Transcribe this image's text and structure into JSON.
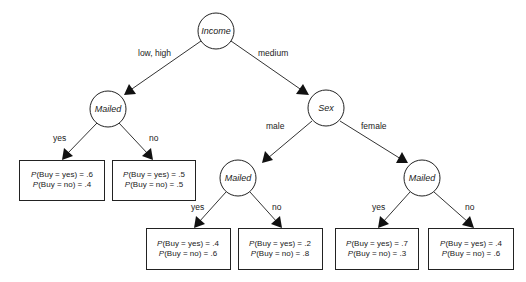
{
  "diagram": {
    "type": "decision-tree",
    "nodes": [
      {
        "id": "income",
        "label": "Income"
      },
      {
        "id": "mailed_1",
        "label": "Mailed"
      },
      {
        "id": "sex",
        "label": "Sex"
      },
      {
        "id": "mailed_2",
        "label": "Mailed"
      },
      {
        "id": "mailed_3",
        "label": "Mailed"
      }
    ],
    "edges": [
      {
        "from": "income",
        "to": "mailed_1",
        "label": "low, high"
      },
      {
        "from": "income",
        "to": "sex",
        "label": "medium"
      },
      {
        "from": "mailed_1",
        "to": "leaf_1",
        "label": "yes"
      },
      {
        "from": "mailed_1",
        "to": "leaf_2",
        "label": "no"
      },
      {
        "from": "sex",
        "to": "mailed_2",
        "label": "male"
      },
      {
        "from": "sex",
        "to": "mailed_3",
        "label": "female"
      },
      {
        "from": "mailed_2",
        "to": "leaf_3",
        "label": "yes"
      },
      {
        "from": "mailed_2",
        "to": "leaf_4",
        "label": "no"
      },
      {
        "from": "mailed_3",
        "to": "leaf_5",
        "label": "yes"
      },
      {
        "from": "mailed_3",
        "to": "leaf_6",
        "label": "no"
      }
    ],
    "leaves": [
      {
        "id": "leaf_1",
        "p_symbol": "P",
        "line1": "(Buy = yes) = .6",
        "line2": "(Buy = no) = .4"
      },
      {
        "id": "leaf_2",
        "p_symbol": "P",
        "line1": "(Buy = yes) = .5",
        "line2": "(Buy = no) = .5"
      },
      {
        "id": "leaf_3",
        "p_symbol": "P",
        "line1": "(Buy = yes) = .4",
        "line2": "(Buy = no) = .6"
      },
      {
        "id": "leaf_4",
        "p_symbol": "P",
        "line1": "(Buy = yes) = .2",
        "line2": "(Buy = no) = .8"
      },
      {
        "id": "leaf_5",
        "p_symbol": "P",
        "line1": "(Buy = yes) = .7",
        "line2": "(Buy = no) = .3"
      },
      {
        "id": "leaf_6",
        "p_symbol": "P",
        "line1": "(Buy = yes) = .4",
        "line2": "(Buy = no) = .6"
      }
    ]
  }
}
